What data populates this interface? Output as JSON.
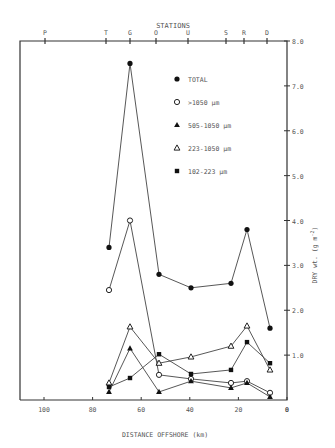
{
  "chart_data": {
    "type": "line",
    "title": "STATIONS",
    "xlabel": "DISTANCE OFFSHORE (km)",
    "ylabel": "DRY wt. (g m-2)",
    "xlim": [
      110,
      0
    ],
    "ylim": [
      0,
      8.0
    ],
    "x_ticks": [
      100,
      80,
      60,
      40,
      20,
      0
    ],
    "y_ticks": [
      0,
      1.0,
      2.0,
      3.0,
      4.0,
      5.0,
      6.0,
      7.0,
      8.0
    ],
    "y_tick_labels": [
      "0",
      "1.0",
      "2.0",
      "3.0",
      "4.0",
      "5.0",
      "6.0",
      "7.0",
      "8.0"
    ],
    "grid": false,
    "legend_position": "upper-center-inside",
    "stations": [
      {
        "name": "P",
        "km": 100
      },
      {
        "name": "T",
        "km": 75
      },
      {
        "name": "G",
        "km": 65
      },
      {
        "name": "O",
        "km": 54
      },
      {
        "name": "U",
        "km": 41
      },
      {
        "name": "S",
        "km": 25
      },
      {
        "name": "R",
        "km": 18
      },
      {
        "name": "D",
        "km": 8
      }
    ],
    "x": [
      74,
      65,
      53,
      40,
      23,
      17,
      7
    ],
    "x_station_names": [
      "T",
      "G",
      "O",
      "U",
      "S",
      "R",
      "D"
    ],
    "series": [
      {
        "name": "TOTAL",
        "marker": "filled-circle",
        "values": [
          3.4,
          7.5,
          2.8,
          2.5,
          2.6,
          3.8,
          1.6
        ]
      },
      {
        "name": ">1050 µm",
        "marker": "open-circle",
        "values": [
          2.45,
          4.0,
          0.56,
          0.47,
          0.38,
          0.42,
          0.16
        ]
      },
      {
        "name": "505-1050 µm",
        "marker": "filled-triangle",
        "values": [
          0.18,
          1.15,
          0.18,
          0.42,
          0.27,
          0.38,
          0.07
        ]
      },
      {
        "name": "223-1050 µm",
        "marker": "open-triangle",
        "values": [
          0.38,
          1.63,
          0.82,
          0.96,
          1.2,
          1.65,
          0.67
        ]
      },
      {
        "name": "102-223 µm",
        "marker": "filled-square",
        "values": [
          0.29,
          0.49,
          1.02,
          0.58,
          0.67,
          1.29,
          0.82
        ]
      }
    ]
  },
  "legend": {
    "items": [
      {
        "label": "TOTAL"
      },
      {
        "label": ">1050 µm"
      },
      {
        "label": "505-1050 µm"
      },
      {
        "label": "223-1050 µm"
      },
      {
        "label": "102-223 µm"
      }
    ]
  },
  "axes": {
    "top_title": "STATIONS",
    "x_title": "DISTANCE OFFSHORE (km)",
    "y_title": "DRY wt. (g m",
    "y_title_sup": "-2",
    "y_title_end": ")"
  }
}
